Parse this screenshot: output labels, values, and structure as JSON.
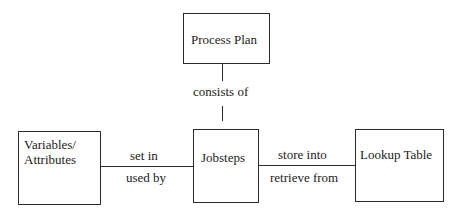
{
  "diagram": {
    "nodes": {
      "process_plan": {
        "label": "Process Plan"
      },
      "variables": {
        "label_line1": "Variables/",
        "label_line2": "Attributes"
      },
      "jobsteps": {
        "label": "Jobsteps"
      },
      "lookup_table": {
        "label": "Lookup Table"
      }
    },
    "edges": {
      "plan_to_jobsteps": {
        "label": "consists of"
      },
      "variables_jobsteps": {
        "label_top": "set in",
        "label_bottom": "used by"
      },
      "jobsteps_lookup": {
        "label_top": "store into",
        "label_bottom": "retrieve from"
      }
    }
  }
}
